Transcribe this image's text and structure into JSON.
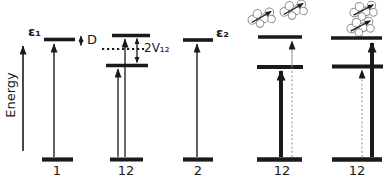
{
  "figure": {
    "background": "#ffffff",
    "ink_color": "#1a1a1a",
    "muted_color": "#8c8c8c"
  },
  "axis": {
    "label": "Energy"
  },
  "annotations": {
    "epsilon1": "ε₁",
    "shift": "D",
    "coupling": "2V₁₂",
    "epsilon2": "ε₂"
  },
  "diagrams": [
    {
      "label": "1"
    },
    {
      "label": "12"
    },
    {
      "label": "2"
    },
    {
      "label": "12"
    },
    {
      "label": "12"
    }
  ]
}
